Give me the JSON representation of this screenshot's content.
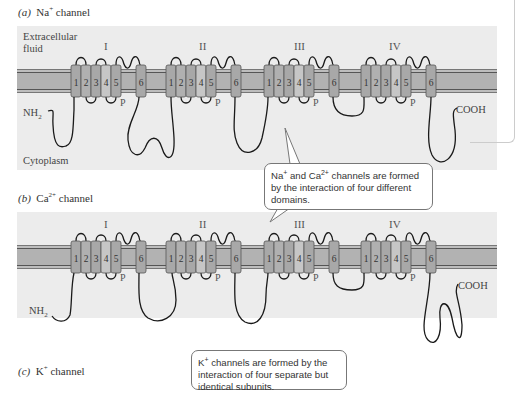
{
  "panels": [
    {
      "id": "a",
      "caption_letter": "(a)",
      "caption_ion": "Na",
      "caption_charge": "+",
      "caption_rest": " channel",
      "extracellular_label_1": "Extracellular",
      "extracellular_label_2": "fluid",
      "cytoplasm_label": "Cytoplasm",
      "n_terminus": "NH",
      "n_terminus_sub": "2",
      "c_terminus": "COOH",
      "domains": [
        "I",
        "II",
        "III",
        "IV"
      ],
      "segments": [
        "1",
        "2",
        "3",
        "4",
        "5",
        "6"
      ],
      "pore_label": "P"
    },
    {
      "id": "b",
      "caption_letter": "(b)",
      "caption_ion": "Ca",
      "caption_charge": "2+",
      "caption_rest": " channel",
      "n_terminus": "NH",
      "n_terminus_sub": "2",
      "c_terminus": "COOH",
      "domains": [
        "I",
        "II",
        "III",
        "IV"
      ],
      "segments": [
        "1",
        "2",
        "3",
        "4",
        "5",
        "6"
      ],
      "pore_label": "P"
    },
    {
      "id": "c",
      "caption_letter": "(c)",
      "caption_ion": "K",
      "caption_charge": "+",
      "caption_rest": " channel"
    }
  ],
  "callouts": {
    "na_ca": {
      "line1_a": "Na",
      "line1_a_sup": "+",
      "line1_b": " and Ca",
      "line1_b_sup": "2+",
      "line1_c": " channels are formed",
      "line2": "by the interaction of four different",
      "line3": "domains."
    },
    "k": {
      "line1_a": "K",
      "line1_a_sup": "+",
      "line1_b": " channels are formed by the",
      "line2": "interaction of four separate but",
      "line3": "identical subunits."
    }
  },
  "colors": {
    "panel_bg": "#ececec",
    "membrane_fill": "#b9b9b9",
    "membrane_line": "#6a6a6a",
    "helix_fill": "#a9a9a9",
    "helix_light": "#c8c8c8",
    "loop_stroke": "#1a1a1a"
  }
}
